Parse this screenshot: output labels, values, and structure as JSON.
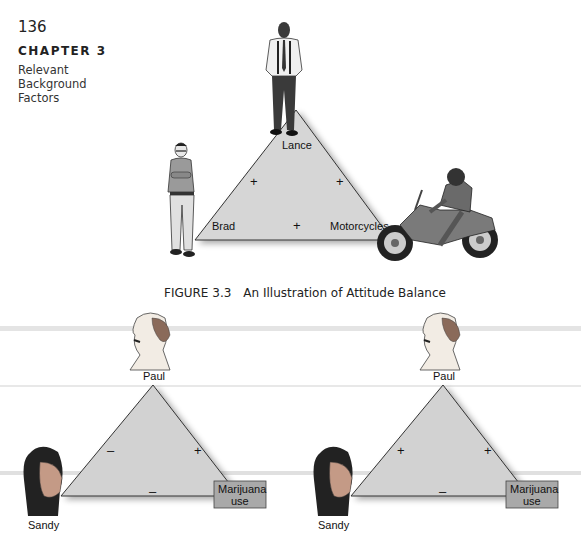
{
  "page": {
    "number": "136",
    "chapter": "CHAPTER 3",
    "chapter_subtitle_lines": [
      "Relevant",
      "Background",
      "Factors"
    ]
  },
  "figure_3_3": {
    "caption_number": "FIGURE 3.3",
    "caption_title": "An Illustration of Attitude Balance",
    "nodes": {
      "top": "Lance",
      "left": "Brad",
      "right": "Motorcycles"
    },
    "relations": {
      "left_edge": "+",
      "right_edge": "+",
      "base": "+"
    }
  },
  "balance_diagrams": [
    {
      "nodes": {
        "top": "Paul",
        "left": "Sandy",
        "right_line1": "Marijuana",
        "right_line2": "use"
      },
      "relations": {
        "left_edge": "–",
        "right_edge": "+",
        "base": "–"
      }
    },
    {
      "nodes": {
        "top": "Paul",
        "left": "Sandy",
        "right_line1": "Marijuana",
        "right_line2": "use"
      },
      "relations": {
        "left_edge": "+",
        "right_edge": "+",
        "base": "–"
      }
    }
  ],
  "colors": {
    "triangle_fill": "#d4d4d4",
    "triangle_stroke": "#3a3a3a",
    "box_fill": "#a8a8a8",
    "band": "#e2e2e2"
  }
}
